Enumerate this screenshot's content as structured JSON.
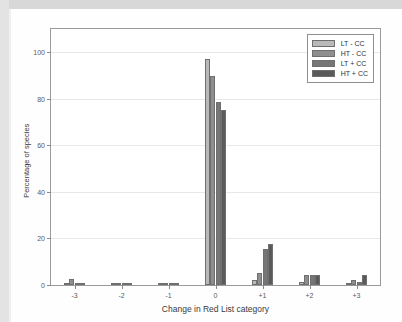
{
  "figure": {
    "background_color": "#ffffff",
    "frame_color": "#d8d8d8",
    "axis_color": "#9a9a9a"
  },
  "legend": {
    "position": "top-right",
    "entries": [
      {
        "label": "LT - CC",
        "color": "#b9b9b9"
      },
      {
        "label": "HT - CC",
        "color": "#8e8e8e"
      },
      {
        "label": "LT + CC",
        "color": "#767676"
      },
      {
        "label": "HT + CC",
        "color": "#5a5a5a"
      }
    ]
  },
  "chart_data": {
    "type": "bar",
    "title": "",
    "subtitle": "",
    "xlabel": "Change in Red List category",
    "ylabel": "Percentage of species",
    "categories": [
      "-3",
      "-2",
      "-1",
      "0",
      "+1",
      "+2",
      "+3"
    ],
    "series": [
      {
        "name": "LT - CC",
        "color": "#b9b9b9",
        "values": [
          0.3,
          0.0,
          0.2,
          97.3,
          2.2,
          1.4,
          0.9
        ]
      },
      {
        "name": "HT - CC",
        "color": "#8e8e8e",
        "values": [
          2.4,
          0.0,
          0.2,
          90.0,
          5.3,
          4.4,
          2.3
        ]
      },
      {
        "name": "LT + CC",
        "color": "#767676",
        "values": [
          0.0,
          0.0,
          0.9,
          78.7,
          15.4,
          4.2,
          1.2
        ]
      },
      {
        "name": "HT + CC",
        "color": "#5a5a5a",
        "values": [
          0.7,
          0.0,
          0.8,
          75.2,
          17.5,
          4.5,
          4.1
        ]
      }
    ],
    "ylim": [
      0,
      110
    ],
    "yticks": [
      0,
      20,
      40,
      60,
      80,
      100
    ],
    "ytick_labels": [
      "0",
      "20",
      "40",
      "60",
      "80",
      "100"
    ],
    "grid": false,
    "legend_position": "top-right"
  }
}
